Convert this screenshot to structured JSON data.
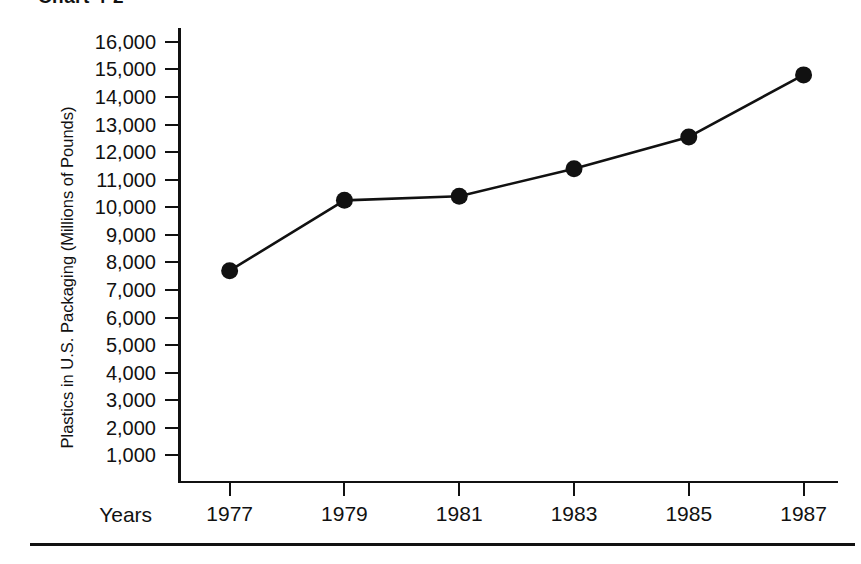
{
  "figure": {
    "title": "Chart 4-2"
  },
  "chart_data": {
    "type": "line",
    "title": "Chart 4-2",
    "xlabel": "Years",
    "ylabel": "Plastics in U.S. Packaging (Millions of Pounds)",
    "x": [
      1977,
      1979,
      1981,
      1983,
      1985,
      1987
    ],
    "categories": [
      "1977",
      "1979",
      "1981",
      "1983",
      "1985",
      "1987"
    ],
    "values": [
      7700,
      10250,
      10400,
      11400,
      12550,
      14800
    ],
    "series": [
      {
        "name": "Plastics in U.S. Packaging",
        "values": [
          7700,
          10250,
          10400,
          11400,
          12550,
          14800
        ]
      }
    ],
    "ylim": [
      0,
      16500
    ],
    "xlim": [
      1976.1,
      1987.6
    ],
    "ytick_labels": [
      "16,000",
      "15,000",
      "14,000",
      "13,000",
      "12,000",
      "11,000",
      "10,000",
      "9,000",
      "8,000",
      "7,000",
      "6,000",
      "5,000",
      "4,000",
      "3,000",
      "2,000",
      "1,000"
    ],
    "ytick_values": [
      16000,
      15000,
      14000,
      13000,
      12000,
      11000,
      10000,
      9000,
      8000,
      7000,
      6000,
      5000,
      4000,
      3000,
      2000,
      1000
    ],
    "xtick_labels": [
      "1977",
      "1979",
      "1981",
      "1983",
      "1985",
      "1987"
    ],
    "grid": false,
    "legend": false,
    "legend_position": "none",
    "marker": "filled-circle",
    "line_color": "#111111",
    "marker_color": "#111111",
    "background_color": "#ffffff"
  }
}
